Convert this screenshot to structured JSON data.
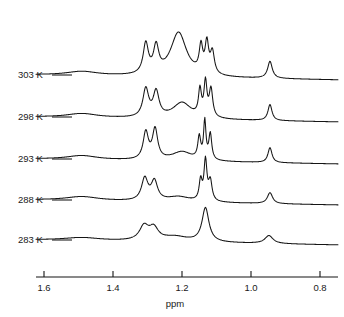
{
  "figure": {
    "kind": "nmr-stack-plot",
    "background_color": "#ffffff",
    "line_color": "#151515"
  },
  "axis": {
    "title": "ppm",
    "tick_labels": [
      "1.6",
      "1.4",
      "1.2",
      "1.0",
      "0.8"
    ],
    "tick_values": [
      1.6,
      1.4,
      1.2,
      1.0,
      0.8
    ],
    "tick_x_px": [
      44,
      113,
      182,
      251,
      320
    ],
    "direction": "reversed",
    "range": [
      1.68,
      0.75
    ],
    "line_y_px": 277,
    "tick_height_px": 6,
    "label_y_px": 291,
    "title_x_px": 175,
    "title_y_px": 307,
    "left_px": 36,
    "right_px": 338
  },
  "traces": [
    {
      "label": "303 K",
      "temperature_k": 303,
      "label_x_px": 18,
      "label_y_px": 78,
      "leader_x1_px": 52,
      "leader_x2_px": 72,
      "leader_y_px": 75,
      "baseline_y_px": 75
    },
    {
      "label": "298 K",
      "temperature_k": 298,
      "label_x_px": 18,
      "label_y_px": 120,
      "leader_x1_px": 52,
      "leader_x2_px": 72,
      "leader_y_px": 117,
      "baseline_y_px": 117
    },
    {
      "label": "293 K",
      "temperature_k": 293,
      "label_x_px": 18,
      "label_y_px": 162,
      "leader_x1_px": 52,
      "leader_x2_px": 72,
      "leader_y_px": 159,
      "baseline_y_px": 159
    },
    {
      "label": "288 K",
      "temperature_k": 288,
      "label_x_px": 18,
      "label_y_px": 203,
      "leader_x1_px": 52,
      "leader_x2_px": 72,
      "leader_y_px": 200,
      "baseline_y_px": 200
    },
    {
      "label": "283 K",
      "temperature_k": 283,
      "label_x_px": 18,
      "label_y_px": 243,
      "leader_x1_px": 52,
      "leader_x2_px": 72,
      "leader_y_px": 240,
      "baseline_y_px": 240
    }
  ],
  "chart_data": {
    "type": "line",
    "title": "",
    "xlabel": "ppm",
    "ylabel": "",
    "xlim": [
      1.68,
      0.75
    ],
    "x_axis_reversed": true,
    "grid": false,
    "legend": "none",
    "series_labels": [
      "303 K",
      "298 K",
      "293 K",
      "288 K",
      "283 K"
    ],
    "annotations": [
      "Variable-temperature 1H NMR stack plot; five spectra offset vertically.",
      "Coalescence behaviour: sharp multiplets at 303 K broaden into a smooth envelope at 283 K."
    ],
    "peaks": {
      "303": [
        {
          "ppm": 1.49,
          "height": 4,
          "width": 0.055,
          "name": "broad-bump-1.49"
        },
        {
          "ppm": 1.305,
          "height": 30,
          "width": 0.009,
          "name": "doublet-left"
        },
        {
          "ppm": 1.275,
          "height": 26,
          "width": 0.009,
          "name": "doublet-right"
        },
        {
          "ppm": 1.21,
          "height": 44,
          "width": 0.028,
          "name": "tall-central"
        },
        {
          "ppm": 1.145,
          "height": 26,
          "width": 0.006,
          "name": "cluster-a"
        },
        {
          "ppm": 1.128,
          "height": 30,
          "width": 0.006,
          "name": "cluster-b"
        },
        {
          "ppm": 1.112,
          "height": 22,
          "width": 0.007,
          "name": "cluster-c"
        },
        {
          "ppm": 0.945,
          "height": 17,
          "width": 0.008,
          "name": "sharp-right"
        }
      ],
      "298": [
        {
          "ppm": 1.49,
          "height": 4,
          "width": 0.055,
          "name": "broad-bump-1.49"
        },
        {
          "ppm": 1.305,
          "height": 28,
          "width": 0.01,
          "name": "doublet-left"
        },
        {
          "ppm": 1.275,
          "height": 25,
          "width": 0.01,
          "name": "doublet-right"
        },
        {
          "ppm": 1.2,
          "height": 16,
          "width": 0.032,
          "name": "broad-central"
        },
        {
          "ppm": 1.148,
          "height": 26,
          "width": 0.005,
          "name": "cluster-a"
        },
        {
          "ppm": 1.132,
          "height": 34,
          "width": 0.005,
          "name": "cluster-b"
        },
        {
          "ppm": 1.116,
          "height": 28,
          "width": 0.006,
          "name": "cluster-c"
        },
        {
          "ppm": 0.945,
          "height": 16,
          "width": 0.007,
          "name": "sharp-right"
        }
      ],
      "293": [
        {
          "ppm": 1.49,
          "height": 4,
          "width": 0.055,
          "name": "broad-bump-1.49"
        },
        {
          "ppm": 1.305,
          "height": 27,
          "width": 0.009,
          "name": "doublet-left"
        },
        {
          "ppm": 1.278,
          "height": 30,
          "width": 0.009,
          "name": "doublet-right"
        },
        {
          "ppm": 1.2,
          "height": 9,
          "width": 0.035,
          "name": "broad-central"
        },
        {
          "ppm": 1.15,
          "height": 22,
          "width": 0.005,
          "name": "cluster-a"
        },
        {
          "ppm": 1.134,
          "height": 38,
          "width": 0.004,
          "name": "cluster-b"
        },
        {
          "ppm": 1.118,
          "height": 26,
          "width": 0.005,
          "name": "cluster-c"
        },
        {
          "ppm": 0.945,
          "height": 15,
          "width": 0.007,
          "name": "sharp-right"
        }
      ],
      "288": [
        {
          "ppm": 1.49,
          "height": 4,
          "width": 0.06,
          "name": "broad-bump-1.49"
        },
        {
          "ppm": 1.308,
          "height": 22,
          "width": 0.011,
          "name": "doublet-left"
        },
        {
          "ppm": 1.28,
          "height": 19,
          "width": 0.011,
          "name": "doublet-right"
        },
        {
          "ppm": 1.21,
          "height": 5,
          "width": 0.04,
          "name": "broad-central"
        },
        {
          "ppm": 1.146,
          "height": 20,
          "width": 0.005,
          "name": "cluster-a"
        },
        {
          "ppm": 1.132,
          "height": 40,
          "width": 0.005,
          "name": "cluster-b"
        },
        {
          "ppm": 1.118,
          "height": 20,
          "width": 0.006,
          "name": "cluster-c"
        },
        {
          "ppm": 0.945,
          "height": 11,
          "width": 0.009,
          "name": "sharp-right"
        }
      ],
      "283": [
        {
          "ppm": 1.49,
          "height": 3,
          "width": 0.065,
          "name": "broad-bump-1.49"
        },
        {
          "ppm": 1.31,
          "height": 14,
          "width": 0.016,
          "name": "doublet-left"
        },
        {
          "ppm": 1.282,
          "height": 12,
          "width": 0.016,
          "name": "doublet-right"
        },
        {
          "ppm": 1.22,
          "height": 5,
          "width": 0.045,
          "name": "broad-central"
        },
        {
          "ppm": 1.132,
          "height": 34,
          "width": 0.012,
          "name": "cluster-merged"
        },
        {
          "ppm": 0.948,
          "height": 8,
          "width": 0.014,
          "name": "sharp-right"
        }
      ]
    },
    "baseline_tilt": {
      "left_ppm": 1.68,
      "right_ppm": 0.75,
      "rise_px": 5,
      "note": "Each trace baseline drifts slightly downward toward low ppm."
    }
  }
}
